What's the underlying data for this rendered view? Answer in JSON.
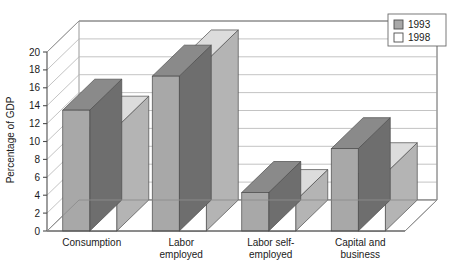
{
  "chart_data": {
    "type": "bar",
    "title": "",
    "subtitle": "",
    "xlabel": "",
    "ylabel": "Percentage of GDP",
    "ylim": [
      0,
      20
    ],
    "yticks": [
      0,
      2,
      4,
      6,
      8,
      10,
      12,
      14,
      16,
      18,
      20
    ],
    "ytick_labels": [
      "0",
      "2",
      "4",
      "6",
      "8",
      "10",
      "12",
      "14",
      "16",
      "18",
      "20"
    ],
    "grid": true,
    "three_d": true,
    "legend_position": "top-right",
    "categories": [
      "Consumption",
      "Labor employed",
      "Labor self-employed",
      "Capital and business"
    ],
    "category_label_lines": [
      [
        "Consumption"
      ],
      [
        "Labor",
        "employed"
      ],
      [
        "Labor self-",
        "employed"
      ],
      [
        "Capital and",
        "business"
      ]
    ],
    "series": [
      {
        "name": "1993",
        "color": "#a8a8a8",
        "values": [
          13.5,
          17.3,
          4.3,
          9.2
        ]
      },
      {
        "name": "1998",
        "color": "#ffffff",
        "values": [
          11.6,
          19.0,
          3.4,
          6.4
        ]
      }
    ]
  },
  "legend": {
    "items": [
      {
        "label": "1993",
        "swatch": "#a8a8a8"
      },
      {
        "label": "1998",
        "swatch": "#ffffff"
      }
    ]
  },
  "colors": {
    "series_1993_front": "#a8a8a8",
    "series_1993_side": "#6e6e6e",
    "series_1993_top": "#8a8a8a",
    "series_1998_front": "#ffffff",
    "series_1998_side": "#b4b4b4",
    "series_1998_top": "#dcdcdc",
    "gridline": "#b4b4b4",
    "axis": "#4d4d4d",
    "text": "#1a1a1a",
    "background": "#ffffff"
  }
}
